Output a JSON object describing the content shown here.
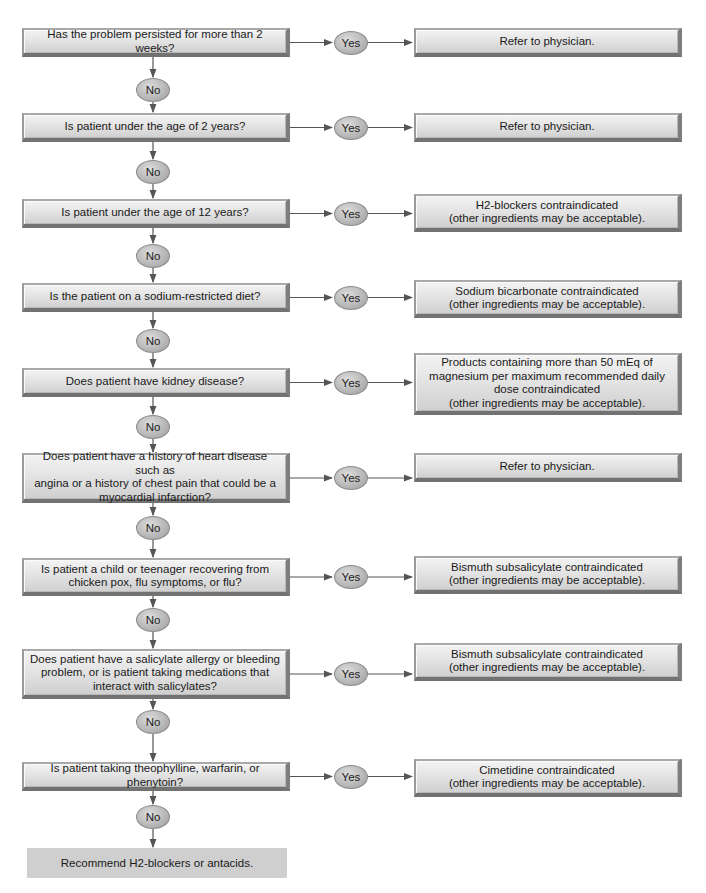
{
  "title_partial": "Figure — Antacid / H2-blocker self-care flowchart",
  "labels": {
    "yes": "Yes",
    "no": "No"
  },
  "rows": [
    {
      "question": "Has the problem persisted for more than 2 weeks?",
      "answer": "Refer to physician."
    },
    {
      "question": "Is patient under the age of 2 years?",
      "answer": "Refer to physician."
    },
    {
      "question": "Is patient under the age of 12 years?",
      "answer": "H2-blockers contraindicated\n(other ingredients may be acceptable)."
    },
    {
      "question": "Is the patient on a sodium-restricted diet?",
      "answer": "Sodium bicarbonate contraindicated\n(other ingredients may be acceptable)."
    },
    {
      "question": "Does patient have kidney disease?",
      "answer": "Products containing more than 50 mEq of\nmagnesium per maximum recommended daily\ndose contraindicated\n(other ingredients may be acceptable)."
    },
    {
      "question": "Does patient have a history of heart disease such as\nangina or a history of chest pain that could be a\nmyocardial infarction?",
      "answer": "Refer to physician."
    },
    {
      "question": "Is patient a child or teenager recovering from\nchicken pox, flu symptoms, or flu?",
      "answer": "Bismuth subsalicylate contraindicated\n(other ingredients may be acceptable)."
    },
    {
      "question": "Does patient have a salicylate allergy or bleeding\nproblem, or is patient taking medications that\ninteract with salicylates?",
      "answer": "Bismuth subsalicylate contraindicated\n(other ingredients may be acceptable)."
    },
    {
      "question": "Is patient taking theophylline, warfarin, or phenytoin?",
      "answer": "Cimetidine contraindicated\n(other ingredients may be acceptable)."
    }
  ],
  "final": "Recommend H2-blockers or antacids."
}
